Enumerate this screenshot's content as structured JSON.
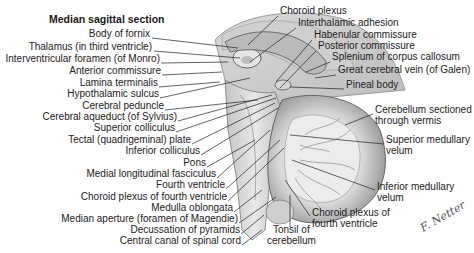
{
  "title": "Median sagittal section",
  "labels_left": [
    {
      "text": "Body of fornix",
      "x": 200,
      "y": 33
    },
    {
      "text": "Thalamus (in third ventricle)",
      "x": 153,
      "y": 46
    },
    {
      "text": "Interventricular foramen (of Monro)",
      "x": 161,
      "y": 58
    },
    {
      "text": "Anterior commissure",
      "x": 162,
      "y": 70
    },
    {
      "text": "Lamina terminalis",
      "x": 159,
      "y": 82
    },
    {
      "text": "Hypothalamic sulcus",
      "x": 160,
      "y": 93
    },
    {
      "text": "Cerebral peduncle",
      "x": 165,
      "y": 105
    },
    {
      "text": "Cerebral aqueduct (of Sylvius)",
      "x": 178,
      "y": 116
    },
    {
      "text": "Superior colliculus",
      "x": 176,
      "y": 127
    },
    {
      "text": "Tectal (quadrigeminal) plate",
      "x": 192,
      "y": 139
    },
    {
      "text": "Inferior colliculus",
      "x": 201,
      "y": 150
    },
    {
      "text": "Pons",
      "x": 207,
      "y": 162
    },
    {
      "text": "Medial longitudinal fasciculus",
      "x": 217,
      "y": 173
    },
    {
      "text": "Fourth ventricle",
      "x": 226,
      "y": 184
    },
    {
      "text": "Choroid plexus of fourth ventricle",
      "x": 228,
      "y": 196
    },
    {
      "text": "Medulla oblongata",
      "x": 234,
      "y": 207
    },
    {
      "text": "Median aperture (foramen of Magendie)",
      "x": 239,
      "y": 218
    },
    {
      "text": "Decussation of pyramids",
      "x": 241,
      "y": 229
    },
    {
      "text": "Central canal of spinal cord",
      "x": 242,
      "y": 240
    }
  ],
  "labels_right": [
    {
      "text": "Choroid plexus",
      "x": 280,
      "y": 10
    },
    {
      "text": "Interthalamic adhesion",
      "x": 298,
      "y": 22
    },
    {
      "text": "Habenular commissure",
      "x": 314,
      "y": 34
    },
    {
      "text": "Posterior commissure",
      "x": 318,
      "y": 45
    },
    {
      "text": "Splenium of corpus callosum",
      "x": 332,
      "y": 56
    },
    {
      "text": "Great cerebral vein (of Galen)",
      "x": 338,
      "y": 69
    },
    {
      "text": "Pineal body",
      "x": 346,
      "y": 84
    },
    {
      "text": "Cerebellum sectioned",
      "x": 375,
      "y": 109
    },
    {
      "text": "through vermis",
      "x": 375,
      "y": 120
    },
    {
      "text": "Superior medullary",
      "x": 386,
      "y": 139
    },
    {
      "text": "velum",
      "x": 386,
      "y": 150
    },
    {
      "text": "Inferior medullary",
      "x": 377,
      "y": 186
    },
    {
      "text": "velum",
      "x": 377,
      "y": 197
    },
    {
      "text": "Choroid plexus of",
      "x": 312,
      "y": 212
    },
    {
      "text": "fourth ventricle",
      "x": 312,
      "y": 223
    },
    {
      "text": "Tonsil of",
      "x": 273,
      "y": 229
    },
    {
      "text": "cerebellum",
      "x": 267,
      "y": 240
    }
  ],
  "signature": "F. Netter"
}
